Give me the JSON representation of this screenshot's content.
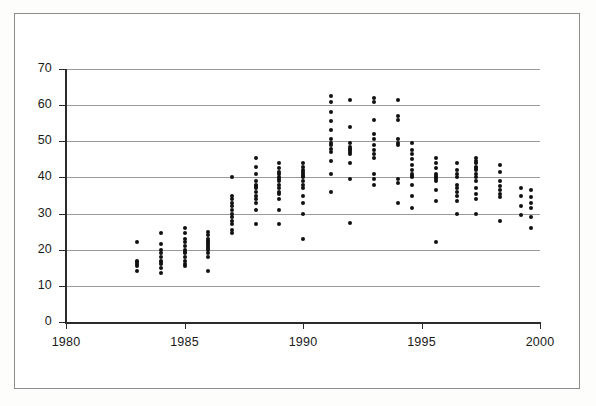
{
  "chart_data": {
    "type": "scatter",
    "title": "",
    "subtitle": "",
    "xlabel": "",
    "ylabel": "",
    "xlim": [
      1980,
      2000
    ],
    "ylim": [
      0,
      70
    ],
    "xticks": [
      1980,
      1985,
      1990,
      1995,
      2000
    ],
    "xtick_labels": [
      "1980",
      "1985",
      "1990",
      "1995",
      "2000"
    ],
    "yticks": [
      0,
      10,
      20,
      30,
      40,
      50,
      60,
      70
    ],
    "ytick_labels": [
      "0",
      "10",
      "20",
      "30",
      "40",
      "50",
      "60",
      "70"
    ],
    "grid": "horizontal",
    "legend": "none",
    "marker": "filled-circle",
    "marker_color": "#111111",
    "point_count": 214,
    "series": [
      {
        "name": "observations",
        "points": [
          [
            1983.0,
            22.0
          ],
          [
            1983.0,
            17.0
          ],
          [
            1983.0,
            16.5
          ],
          [
            1983.0,
            16.0
          ],
          [
            1983.0,
            15.5
          ],
          [
            1983.0,
            14.0
          ],
          [
            1984.0,
            24.5
          ],
          [
            1984.0,
            21.5
          ],
          [
            1984.0,
            20.0
          ],
          [
            1984.0,
            19.0
          ],
          [
            1984.0,
            18.0
          ],
          [
            1984.0,
            17.0
          ],
          [
            1984.0,
            16.5
          ],
          [
            1984.0,
            16.0
          ],
          [
            1984.0,
            15.0
          ],
          [
            1984.0,
            13.5
          ],
          [
            1985.0,
            26.0
          ],
          [
            1985.0,
            24.5
          ],
          [
            1985.0,
            23.0
          ],
          [
            1985.0,
            22.0
          ],
          [
            1985.0,
            21.0
          ],
          [
            1985.0,
            20.0
          ],
          [
            1985.0,
            19.5
          ],
          [
            1985.0,
            19.0
          ],
          [
            1985.0,
            18.0
          ],
          [
            1985.0,
            17.0
          ],
          [
            1985.0,
            16.0
          ],
          [
            1985.0,
            15.5
          ],
          [
            1986.0,
            25.0
          ],
          [
            1986.0,
            24.0
          ],
          [
            1986.0,
            23.0
          ],
          [
            1986.0,
            22.5
          ],
          [
            1986.0,
            22.0
          ],
          [
            1986.0,
            21.5
          ],
          [
            1986.0,
            21.0
          ],
          [
            1986.0,
            20.5
          ],
          [
            1986.0,
            20.0
          ],
          [
            1986.0,
            19.0
          ],
          [
            1986.0,
            18.0
          ],
          [
            1986.0,
            14.0
          ],
          [
            1987.0,
            40.0
          ],
          [
            1987.0,
            35.0
          ],
          [
            1987.0,
            34.0
          ],
          [
            1987.0,
            33.0
          ],
          [
            1987.0,
            32.0
          ],
          [
            1987.0,
            31.0
          ],
          [
            1987.0,
            30.0
          ],
          [
            1987.0,
            29.0
          ],
          [
            1987.0,
            28.0
          ],
          [
            1987.0,
            27.0
          ],
          [
            1987.0,
            25.5
          ],
          [
            1987.0,
            24.5
          ],
          [
            1988.0,
            45.5
          ],
          [
            1988.0,
            43.0
          ],
          [
            1988.0,
            41.0
          ],
          [
            1988.0,
            39.0
          ],
          [
            1988.0,
            38.0
          ],
          [
            1988.0,
            37.5
          ],
          [
            1988.0,
            37.0
          ],
          [
            1988.0,
            36.0
          ],
          [
            1988.0,
            35.0
          ],
          [
            1988.0,
            34.0
          ],
          [
            1988.0,
            33.0
          ],
          [
            1988.0,
            31.0
          ],
          [
            1988.0,
            27.0
          ],
          [
            1989.0,
            44.0
          ],
          [
            1989.0,
            42.5
          ],
          [
            1989.0,
            41.5
          ],
          [
            1989.0,
            41.0
          ],
          [
            1989.0,
            40.0
          ],
          [
            1989.0,
            39.5
          ],
          [
            1989.0,
            39.0
          ],
          [
            1989.0,
            38.0
          ],
          [
            1989.0,
            37.0
          ],
          [
            1989.0,
            36.0
          ],
          [
            1989.0,
            35.5
          ],
          [
            1989.0,
            34.0
          ],
          [
            1989.0,
            31.0
          ],
          [
            1989.0,
            27.0
          ],
          [
            1990.0,
            44.0
          ],
          [
            1990.0,
            43.0
          ],
          [
            1990.0,
            42.0
          ],
          [
            1990.0,
            41.5
          ],
          [
            1990.0,
            41.0
          ],
          [
            1990.0,
            40.5
          ],
          [
            1990.0,
            40.0
          ],
          [
            1990.0,
            39.0
          ],
          [
            1990.0,
            38.0
          ],
          [
            1990.0,
            37.0
          ],
          [
            1990.0,
            35.0
          ],
          [
            1990.0,
            33.0
          ],
          [
            1990.0,
            30.0
          ],
          [
            1990.0,
            23.0
          ],
          [
            1991.2,
            62.5
          ],
          [
            1991.2,
            61.0
          ],
          [
            1991.2,
            58.0
          ],
          [
            1991.2,
            55.5
          ],
          [
            1991.2,
            53.0
          ],
          [
            1991.2,
            50.5
          ],
          [
            1991.2,
            49.5
          ],
          [
            1991.2,
            49.0
          ],
          [
            1991.2,
            48.0
          ],
          [
            1991.2,
            47.0
          ],
          [
            1991.2,
            44.5
          ],
          [
            1991.2,
            41.0
          ],
          [
            1991.2,
            36.0
          ],
          [
            1992.0,
            61.5
          ],
          [
            1992.0,
            54.0
          ],
          [
            1992.0,
            49.5
          ],
          [
            1992.0,
            48.5
          ],
          [
            1992.0,
            48.0
          ],
          [
            1992.0,
            47.5
          ],
          [
            1992.0,
            47.0
          ],
          [
            1992.0,
            46.5
          ],
          [
            1992.0,
            44.0
          ],
          [
            1992.0,
            39.5
          ],
          [
            1992.0,
            27.5
          ],
          [
            1993.0,
            62.0
          ],
          [
            1993.0,
            61.0
          ],
          [
            1993.0,
            56.0
          ],
          [
            1993.0,
            52.0
          ],
          [
            1993.0,
            50.5
          ],
          [
            1993.0,
            49.0
          ],
          [
            1993.0,
            47.5
          ],
          [
            1993.0,
            46.5
          ],
          [
            1993.0,
            45.5
          ],
          [
            1993.0,
            41.0
          ],
          [
            1993.0,
            39.5
          ],
          [
            1993.0,
            38.0
          ],
          [
            1994.0,
            61.5
          ],
          [
            1994.0,
            57.0
          ],
          [
            1994.0,
            56.0
          ],
          [
            1994.0,
            50.5
          ],
          [
            1994.0,
            49.5
          ],
          [
            1994.0,
            49.0
          ],
          [
            1994.0,
            39.5
          ],
          [
            1994.0,
            38.5
          ],
          [
            1994.0,
            33.0
          ],
          [
            1994.6,
            49.5
          ],
          [
            1994.6,
            47.5
          ],
          [
            1994.6,
            46.5
          ],
          [
            1994.6,
            45.0
          ],
          [
            1994.6,
            43.5
          ],
          [
            1994.6,
            42.0
          ],
          [
            1994.6,
            41.0
          ],
          [
            1994.6,
            40.5
          ],
          [
            1994.6,
            40.0
          ],
          [
            1994.6,
            38.0
          ],
          [
            1994.6,
            35.0
          ],
          [
            1994.6,
            31.5
          ],
          [
            1995.6,
            45.5
          ],
          [
            1995.6,
            44.0
          ],
          [
            1995.6,
            42.5
          ],
          [
            1995.6,
            41.0
          ],
          [
            1995.6,
            40.5
          ],
          [
            1995.6,
            40.0
          ],
          [
            1995.6,
            39.5
          ],
          [
            1995.6,
            39.0
          ],
          [
            1995.6,
            36.5
          ],
          [
            1995.6,
            33.5
          ],
          [
            1995.6,
            22.0
          ],
          [
            1996.5,
            44.0
          ],
          [
            1996.5,
            42.0
          ],
          [
            1996.5,
            41.0
          ],
          [
            1996.5,
            40.0
          ],
          [
            1996.5,
            38.0
          ],
          [
            1996.5,
            37.0
          ],
          [
            1996.5,
            36.0
          ],
          [
            1996.5,
            35.0
          ],
          [
            1996.5,
            33.5
          ],
          [
            1996.5,
            30.0
          ],
          [
            1997.3,
            45.5
          ],
          [
            1997.3,
            44.5
          ],
          [
            1997.3,
            44.0
          ],
          [
            1997.3,
            43.0
          ],
          [
            1997.3,
            42.5
          ],
          [
            1997.3,
            42.0
          ],
          [
            1997.3,
            41.0
          ],
          [
            1997.3,
            40.0
          ],
          [
            1997.3,
            39.0
          ],
          [
            1997.3,
            37.0
          ],
          [
            1997.3,
            35.5
          ],
          [
            1997.3,
            34.0
          ],
          [
            1997.3,
            30.0
          ],
          [
            1998.3,
            43.5
          ],
          [
            1998.3,
            41.5
          ],
          [
            1998.3,
            39.0
          ],
          [
            1998.3,
            37.5
          ],
          [
            1998.3,
            36.5
          ],
          [
            1998.3,
            35.5
          ],
          [
            1998.3,
            34.5
          ],
          [
            1998.3,
            28.0
          ],
          [
            1999.2,
            37.0
          ],
          [
            1999.2,
            35.0
          ],
          [
            1999.2,
            32.0
          ],
          [
            1999.2,
            29.5
          ],
          [
            1999.6,
            36.5
          ],
          [
            1999.6,
            34.5
          ],
          [
            1999.6,
            33.0
          ],
          [
            1999.6,
            31.5
          ],
          [
            1999.6,
            29.0
          ],
          [
            1999.6,
            26.0
          ]
        ]
      }
    ],
    "colors": {
      "marker": "#111111",
      "gridline": "#9a9a9a",
      "axis": "#2b2b2b",
      "frame": "#8d8d8d",
      "background": "#ffffff"
    }
  }
}
